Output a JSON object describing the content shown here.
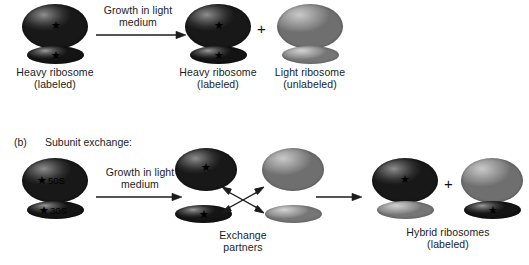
{
  "figure": {
    "title_visible": false,
    "colors": {
      "dark_subunit": "#2d2d2d",
      "light_subunit": "#9b9b9b",
      "text": "#1b1b1b",
      "arrow": "#1b1b1b",
      "background": "#ffffff"
    },
    "star_glyph": "★",
    "plus_glyph": "+"
  },
  "panel_a": {
    "arrow_label": "Growth in light\nmedium",
    "left_ribosome": {
      "caption": "Heavy ribosome\n(labeled)",
      "large_subunit": {
        "shade": "dark",
        "star": true
      },
      "small_subunit": {
        "shade": "dark",
        "star": true
      }
    },
    "right_ribosome_1": {
      "caption": "Heavy ribosome\n(labeled)",
      "large_subunit": {
        "shade": "dark",
        "star": true
      },
      "small_subunit": {
        "shade": "dark",
        "star": true
      }
    },
    "plus": "+",
    "right_ribosome_2": {
      "caption": "Light ribosome\n(unlabeled)",
      "large_subunit": {
        "shade": "light",
        "star": false
      },
      "small_subunit": {
        "shade": "light",
        "star": false
      }
    }
  },
  "panel_b": {
    "label": "(b)",
    "heading": "Subunit exchange:",
    "arrow_label": "Growth in light\nmedium",
    "start_ribosome": {
      "large_subunit": {
        "shade": "dark",
        "star": true,
        "label": "50S"
      },
      "small_subunit": {
        "shade": "dark",
        "star": true,
        "label": "30S"
      }
    },
    "exchange": {
      "caption": "Exchange\npartners",
      "dark_large": {
        "shade": "dark",
        "star": true
      },
      "dark_small": {
        "shade": "dark",
        "star": true
      },
      "light_large": {
        "shade": "light",
        "star": false
      },
      "light_small": {
        "shade": "light",
        "star": false
      },
      "arrow_kind": "crossed-double-headed"
    },
    "products": {
      "caption": "Hybrid ribosomes\n(labeled)",
      "plus": "+",
      "hybrid_1": {
        "large_subunit": {
          "shade": "dark",
          "star": true
        },
        "small_subunit": {
          "shade": "light",
          "star": false
        }
      },
      "hybrid_2": {
        "large_subunit": {
          "shade": "light",
          "star": false
        },
        "small_subunit": {
          "shade": "dark",
          "star": true
        }
      }
    }
  }
}
